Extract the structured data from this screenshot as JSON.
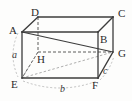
{
  "figure": {
    "kind": "rectangular-box-diagram",
    "title": "",
    "background_color": "#fdfdfc",
    "solid_edge_color": "#3c3c3c",
    "hidden_edge_color": "#4a4a4a",
    "diagonal_color": "#3c3c3c",
    "measure_arc_color": "#9a9a9a",
    "label_color": "#2b2b2b"
  },
  "vertices": [
    {
      "name": "A",
      "label": "A",
      "x": 22,
      "y": 32,
      "label_x": 9,
      "label_y": 26,
      "hidden": false
    },
    {
      "name": "B",
      "label": "B",
      "x": 98,
      "y": 32,
      "label_x": 100,
      "label_y": 34,
      "hidden": false
    },
    {
      "name": "C",
      "label": "C",
      "x": 113,
      "y": 17,
      "label_x": 118,
      "label_y": 8,
      "hidden": false
    },
    {
      "name": "D",
      "label": "D",
      "x": 38,
      "y": 17,
      "label_x": 31,
      "label_y": 7,
      "hidden": false
    },
    {
      "name": "E",
      "label": "E",
      "x": 22,
      "y": 78,
      "label_x": 11,
      "label_y": 79,
      "hidden": false
    },
    {
      "name": "F",
      "label": "F",
      "x": 98,
      "y": 78,
      "label_x": 92,
      "label_y": 80,
      "hidden": false
    },
    {
      "name": "G",
      "label": "G",
      "x": 113,
      "y": 52,
      "label_x": 118,
      "label_y": 48,
      "hidden": false
    },
    {
      "name": "H",
      "label": "H",
      "x": 38,
      "y": 52,
      "label_x": 37,
      "label_y": 54,
      "hidden": true
    }
  ],
  "edges": {
    "solid": [
      {
        "from": "A",
        "to": "D"
      },
      {
        "from": "D",
        "to": "C"
      },
      {
        "from": "C",
        "to": "B"
      },
      {
        "from": "A",
        "to": "B"
      },
      {
        "from": "A",
        "to": "E"
      },
      {
        "from": "B",
        "to": "F"
      },
      {
        "from": "C",
        "to": "G"
      },
      {
        "from": "E",
        "to": "F"
      },
      {
        "from": "F",
        "to": "G"
      }
    ],
    "hidden": [
      {
        "from": "D",
        "to": "H"
      },
      {
        "from": "H",
        "to": "E"
      },
      {
        "from": "H",
        "to": "G"
      }
    ]
  },
  "diagonals": [
    {
      "from": "A",
      "to": "G",
      "style": "solid"
    },
    {
      "from": "E",
      "to": "G",
      "style": "solid"
    },
    {
      "from": "E",
      "to": "H",
      "style": "dashed"
    },
    {
      "from": "E",
      "to": "B",
      "style": "dashed"
    }
  ],
  "dimension_labels": [
    {
      "name": "a",
      "label": "a",
      "measures": "A-E",
      "x": 12,
      "y": 50
    },
    {
      "name": "b",
      "label": "b",
      "measures": "E-F",
      "x": 60,
      "y": 84
    },
    {
      "name": "c",
      "label": "c",
      "measures": "F-G",
      "x": 103,
      "y": 66
    }
  ],
  "measure_arcs": [
    {
      "name": "arc-a",
      "for": "a"
    },
    {
      "name": "arc-b",
      "for": "b"
    },
    {
      "name": "arc-c",
      "for": "c"
    }
  ]
}
